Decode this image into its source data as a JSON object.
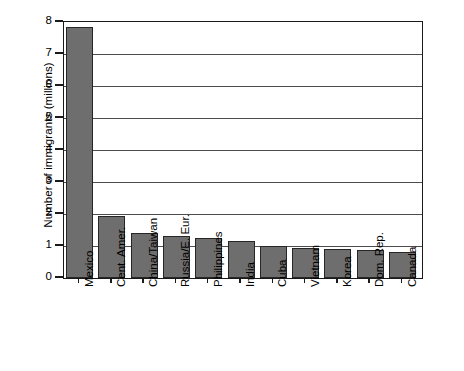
{
  "chart_data": {
    "type": "bar",
    "title": "",
    "subtitle": "",
    "xlabel": "",
    "ylabel": "Number of immigrants (millions)",
    "ylim": [
      0,
      8
    ],
    "ytick_labels": [
      "0",
      "1",
      "2",
      "3",
      "4",
      "5",
      "6",
      "7",
      "8"
    ],
    "ytick_values": [
      0,
      1,
      2,
      3,
      4,
      5,
      6,
      7,
      8
    ],
    "grid": true,
    "grid_axis": "y",
    "legend": null,
    "orientation": "vertical",
    "bar_color": "#6e6e6e",
    "bar_edge_color": "#262626",
    "axis_color": "#1a1a1a",
    "background": "#ffffff",
    "xlabel_rotation": 90,
    "categories": [
      "Mexico",
      "Cent. Amer.",
      "China/Taiwan",
      "Russia/E. Eur.",
      "Philippines",
      "India",
      "Cuba",
      "Vietnam",
      "Korea",
      "Dom. Rep.",
      "Canada"
    ],
    "values": [
      7.85,
      1.95,
      1.4,
      1.3,
      1.25,
      1.15,
      1.0,
      0.95,
      0.9,
      0.88,
      0.8
    ]
  }
}
